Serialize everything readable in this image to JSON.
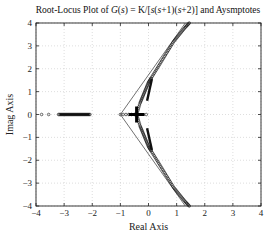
{
  "chart_data": {
    "type": "scatter",
    "title": "Root-Locus Plot of G(s) = K/[s(s+1)(s+2)] and Aysmptotes",
    "title_parts": {
      "prefix": "Root-Locus Plot of ",
      "G": "G",
      "s1": "s",
      "mid": ") = K/[",
      "s2": "s",
      "p1": "(",
      "s3": "s",
      "p2": "+1)(",
      "s4": "s",
      "suffix": "+2)] and Aysmptotes"
    },
    "xlabel": "Real Axis",
    "ylabel": "Imag Axis",
    "xlim": [
      -4,
      4
    ],
    "ylim": [
      -4,
      4
    ],
    "xticks": [
      -4,
      -3,
      -2,
      -1,
      0,
      1,
      2,
      3,
      4
    ],
    "yticks": [
      -4,
      -3,
      -2,
      -1,
      0,
      1,
      2,
      3,
      4
    ],
    "grid": true,
    "open_loop_poles": [
      0,
      -1,
      -2
    ],
    "asymptote_centroid": -1,
    "asymptote_angles_deg": [
      60,
      180,
      -60
    ],
    "breakaway_point": -0.423,
    "series": [
      {
        "name": "real-axis branch to -inf",
        "x": [
          -3.8,
          -3.55,
          -3.2,
          -3.0,
          -2.8,
          -2.6,
          -2.4,
          -2.2,
          -2.05
        ],
        "y": [
          0,
          0,
          0,
          0,
          0,
          0,
          0,
          0,
          0
        ]
      },
      {
        "name": "upper complex branch",
        "x": [
          -0.42,
          -0.3,
          -0.2,
          -0.1,
          0.0,
          0.1,
          0.3,
          0.5,
          0.7,
          0.9,
          1.1,
          1.3,
          1.45
        ],
        "y": [
          0,
          0.5,
          0.8,
          1.1,
          1.4,
          1.6,
          2.0,
          2.4,
          2.8,
          3.2,
          3.5,
          3.8,
          4.0
        ]
      },
      {
        "name": "lower complex branch",
        "x": [
          -0.42,
          -0.3,
          -0.2,
          -0.1,
          0.0,
          0.1,
          0.3,
          0.5,
          0.7,
          0.9,
          1.1,
          1.3,
          1.45
        ],
        "y": [
          0,
          -0.5,
          -0.8,
          -1.1,
          -1.4,
          -1.6,
          -2.0,
          -2.4,
          -2.8,
          -3.2,
          -3.5,
          -3.8,
          -4.0
        ]
      },
      {
        "name": "real-axis segment between 0 and -1",
        "x": [
          -1.0,
          -0.9,
          -0.8,
          -0.7,
          -0.6,
          -0.5,
          -0.1,
          0.0
        ],
        "y": [
          0,
          0,
          0,
          0,
          0,
          0,
          0,
          0
        ]
      }
    ]
  }
}
